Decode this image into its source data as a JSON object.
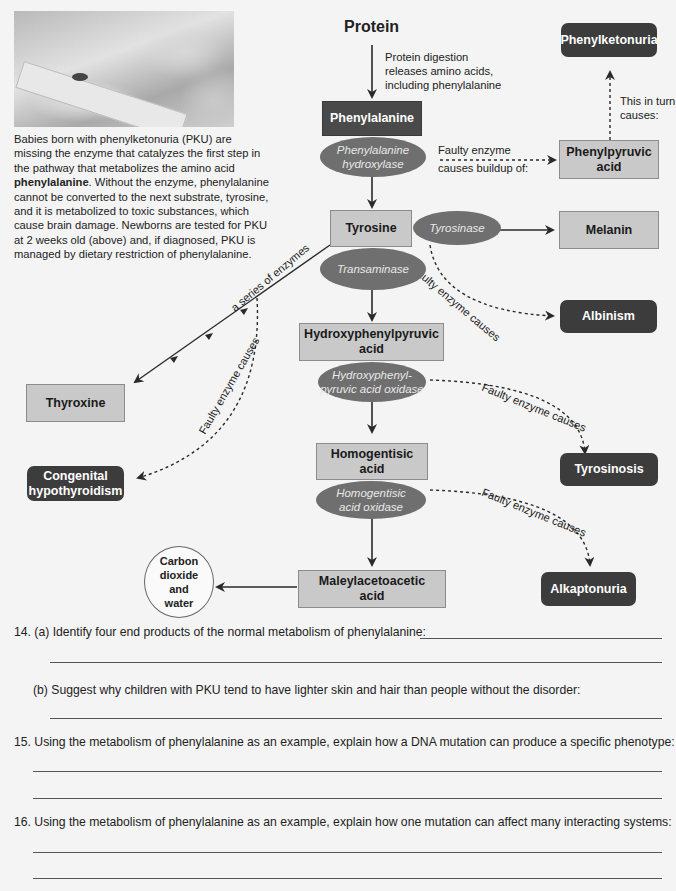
{
  "photo": {
    "alt": "Newborn heel-prick blood test for PKU",
    "icon": "photo-newborn-heel-test"
  },
  "intro": {
    "part1": "Babies born with phenylketonuria (PKU) are missing the enzyme that catalyzes the first step in the pathway that metabolizes the amino acid ",
    "bold": "phenylalanine",
    "part2": ". Without the enzyme, phenylalanine cannot be converted to the next substrate, tyrosine, and it is metabolized to toxic substances, which cause brain damage. Newborns are tested for PKU at 2 weeks old (above) and, if diagnosed, PKU is managed by dietary restriction of phenylalanine."
  },
  "diagram": {
    "protein": "Protein",
    "protein_note": [
      "Protein digestion",
      "releases amino acids,",
      "including phenylalanine"
    ],
    "substrates": {
      "phenylalanine": "Phenylalanine",
      "tyrosine": "Tyrosine",
      "hppa": [
        "Hydroxyphenylpyruvic",
        "acid"
      ],
      "homogentisic": [
        "Homogentisic",
        "acid"
      ],
      "maleylacetoacetic": [
        "Maleylacetoacetic",
        "acid"
      ],
      "phenylpyruvic": [
        "Phenylpyruvic",
        "acid"
      ],
      "melanin": "Melanin",
      "thyroxine": "Thyroxine"
    },
    "enzymes": {
      "pah": [
        "Phenylalanine",
        "hydroxylase"
      ],
      "tyrosinase": "Tyrosinase",
      "transaminase": "Transaminase",
      "hppa_oxidase": [
        "Hydroxyphenyl-",
        "pyruvic acid oxidase"
      ],
      "hga_oxidase": [
        "Homogentisic",
        "acid oxidase"
      ]
    },
    "disorders": {
      "pku": "Phenylketonuria",
      "albinism": "Albinism",
      "tyrosinosis": "Tyrosinosis",
      "alkaptonuria": "Alkaptonuria",
      "hypothyroidism": [
        "Congenital",
        "hypothyroidism"
      ]
    },
    "end_product": [
      "Carbon",
      "dioxide",
      "and",
      "water"
    ],
    "labels": {
      "buildup": [
        "Faulty enzyme",
        "causes buildup of:"
      ],
      "in_turn": [
        "This in turn",
        "causes:"
      ],
      "faulty": "Faulty enzyme causes",
      "series": "a series of enzymes"
    },
    "colors": {
      "dark_box": "#4a4a4a",
      "disorder_box": "#3c3c3c",
      "light_box": "#c9c9c9",
      "enzyme_ellipse": "#6f6f6f",
      "background": "#f4f4f4"
    }
  },
  "questions": [
    {
      "number": "14.",
      "part": "(a)",
      "text": "Identify four end products of the normal metabolism of phenylalanine:"
    },
    {
      "part": "(b)",
      "text": "Suggest why children with PKU tend to have lighter skin and hair than people without the disorder:"
    },
    {
      "number": "15.",
      "text": "Using the metabolism of phenylalanine as an example, explain how a DNA mutation can produce a specific phenotype:"
    },
    {
      "number": "16.",
      "text": "Using the metabolism of phenylalanine as an example, explain how one mutation can affect many interacting systems:"
    }
  ]
}
